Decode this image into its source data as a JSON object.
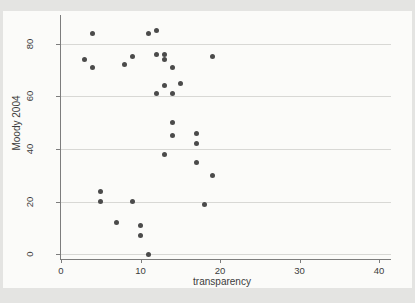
{
  "chart_data": {
    "type": "scatter",
    "title": "",
    "xlabel": "transparency",
    "ylabel": "Moody 2004",
    "xticks": [
      0,
      10,
      20,
      30,
      40
    ],
    "yticks": [
      0,
      20,
      40,
      60,
      80
    ],
    "xlim": [
      0,
      41.5
    ],
    "ylim": [
      -2,
      91
    ],
    "grid": "horizontal-only",
    "legend": "none",
    "marker_color": "#4b4b4b",
    "gridline_color": "#d8d8d5",
    "axis_color": "#7d7d7d",
    "text_color": "#3c3c3c",
    "canvas_color": "#fbfbf9",
    "frame_color": "#e4e4e2",
    "points": [
      [
        4,
        84
      ],
      [
        3,
        74
      ],
      [
        4,
        71
      ],
      [
        8,
        72
      ],
      [
        9,
        75
      ],
      [
        11,
        84
      ],
      [
        12,
        85
      ],
      [
        12,
        76
      ],
      [
        13,
        76
      ],
      [
        13,
        74
      ],
      [
        14,
        71
      ],
      [
        15,
        65
      ],
      [
        13,
        64
      ],
      [
        12,
        61
      ],
      [
        14,
        61
      ],
      [
        19,
        75
      ],
      [
        14,
        50
      ],
      [
        14,
        45
      ],
      [
        17,
        46
      ],
      [
        17,
        42
      ],
      [
        13,
        38
      ],
      [
        17,
        35
      ],
      [
        19,
        30
      ],
      [
        18,
        19
      ],
      [
        5,
        24
      ],
      [
        5,
        20
      ],
      [
        9,
        20
      ],
      [
        7,
        12
      ],
      [
        10,
        11
      ],
      [
        10,
        7
      ],
      [
        11,
        0
      ]
    ]
  }
}
